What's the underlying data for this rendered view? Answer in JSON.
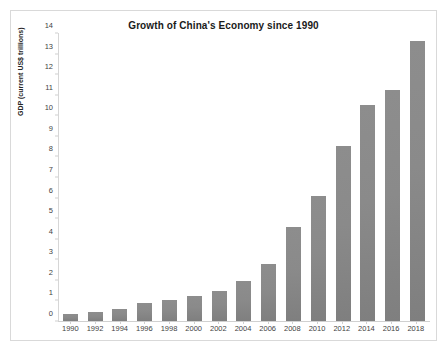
{
  "chart_data": {
    "type": "bar",
    "title": "Growth of China's Economy since 1990",
    "xlabel": "",
    "ylabel": "GDP (current US$ trillions)",
    "categories": [
      "1990",
      "1992",
      "1994",
      "1996",
      "1998",
      "2000",
      "2002",
      "2004",
      "2006",
      "2008",
      "2010",
      "2012",
      "2014",
      "2016",
      "2018"
    ],
    "values": [
      0.36,
      0.43,
      0.56,
      0.86,
      1.03,
      1.21,
      1.47,
      1.96,
      2.75,
      4.59,
      6.09,
      8.53,
      10.48,
      11.23,
      13.61
    ],
    "ylim": [
      0,
      14
    ],
    "yticks": [
      0,
      1,
      2,
      3,
      4,
      5,
      6,
      7,
      8,
      9,
      10,
      11,
      12,
      13,
      14
    ],
    "ytick_labels": [
      "0",
      "1",
      "2",
      "3",
      "4",
      "5",
      "6",
      "7",
      "8",
      "9",
      "10",
      "11",
      "12",
      "13",
      "14"
    ],
    "grid": false,
    "legend": false,
    "bar_color": "#858585",
    "series_name": "GDP"
  }
}
